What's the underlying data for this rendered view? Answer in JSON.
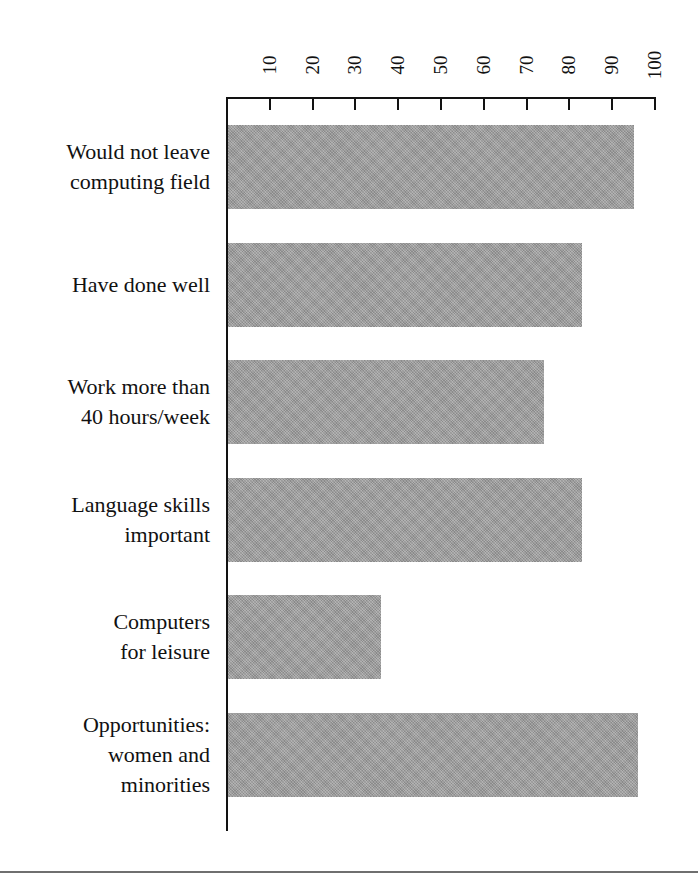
{
  "figure": {
    "background_color": "#ffffff",
    "bar_color": "#9b9b9b",
    "axis_color": "#121212",
    "rule_color": "#6f6f6f"
  },
  "chart_data": {
    "type": "bar",
    "orientation": "horizontal",
    "title": "",
    "subtitle": "",
    "xlabel": "",
    "ylabel": "",
    "xlim": [
      0,
      100
    ],
    "grid": false,
    "legend": null,
    "categories": [
      "Would not leave\ncomputing field",
      "Have done well",
      "Work more than\n40 hours/week",
      "Language skills\nimportant",
      "Computers\nfor leisure",
      "Opportunities:\nwomen and\nminorities"
    ],
    "category_lines": [
      [
        "Would not leave",
        "computing field"
      ],
      [
        "Have done well"
      ],
      [
        "Work more than",
        "40 hours/week"
      ],
      [
        "Language skills",
        "important"
      ],
      [
        "Computers",
        "for leisure"
      ],
      [
        "Opportunities:",
        "women and",
        "minorities"
      ]
    ],
    "values": [
      95,
      83,
      74,
      83,
      36,
      96
    ],
    "tick_values": [
      10,
      20,
      30,
      40,
      50,
      60,
      70,
      80,
      90,
      100
    ],
    "tick_labels": [
      "10",
      "20",
      "30",
      "40",
      "50",
      "60",
      "70",
      "80",
      "90",
      "100"
    ],
    "axis_position": "top"
  }
}
